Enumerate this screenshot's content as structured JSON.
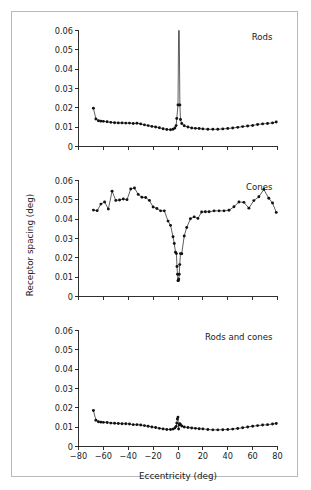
{
  "figure": {
    "background_color": "#ffffff",
    "frame_color": "#b9b9b9",
    "line_color": "#2b2b2b",
    "point_color": "#111111",
    "axis_color": "#1a1a1a",
    "y_axis_title": "Receptor spacing (deg)",
    "x_axis_title": "Eccentricity (deg)"
  },
  "chart_data": [
    {
      "type": "line",
      "title": "Rods",
      "panel_index": 0,
      "xlabel": "",
      "ylabel": "Receptor spacing (deg)",
      "xlim": [
        -80,
        80
      ],
      "ylim": [
        0,
        0.06
      ],
      "yticks": [
        0,
        0.01,
        0.02,
        0.03,
        0.04,
        0.05,
        0.06
      ],
      "ytick_labels": [
        "0",
        "0.01",
        "0.02",
        "0.03",
        "0.04",
        "0.05",
        "0.06"
      ],
      "xticks": [
        -80,
        -60,
        -40,
        -20,
        0,
        20,
        40,
        60,
        80
      ],
      "xtick_labels": [
        "",
        "",
        "",
        "",
        "",
        "",
        "",
        "",
        ""
      ],
      "grid": false,
      "legend": "none",
      "annotation": "Spike exceeds axis maximum at fovea (0 deg): rods absent",
      "x": [
        -68,
        -66,
        -64,
        -62,
        -60,
        -57,
        -54,
        -51,
        -48,
        -45,
        -42,
        -39,
        -36,
        -33,
        -30,
        -27,
        -24,
        -21,
        -18,
        -15,
        -12,
        -9,
        -6,
        -4,
        -2.5,
        -1.5,
        -1,
        0,
        0.5,
        1,
        1.5,
        2,
        3,
        5,
        8,
        11,
        14,
        17,
        20,
        24,
        28,
        32,
        36,
        40,
        44,
        48,
        52,
        56,
        60,
        64,
        68,
        72,
        76,
        79
      ],
      "y": [
        0.0198,
        0.0142,
        0.0133,
        0.0131,
        0.013,
        0.0128,
        0.0125,
        0.0123,
        0.0122,
        0.0122,
        0.0121,
        0.0121,
        0.0119,
        0.012,
        0.0117,
        0.0112,
        0.0108,
        0.0104,
        0.0101,
        0.0097,
        0.0092,
        0.0088,
        0.0087,
        0.0089,
        0.0096,
        0.0108,
        0.0145,
        0.0215,
        0.06,
        0.06,
        0.0215,
        0.014,
        0.0119,
        0.0107,
        0.0101,
        0.0096,
        0.0094,
        0.0093,
        0.0091,
        0.0089,
        0.0089,
        0.0089,
        0.0091,
        0.0093,
        0.0096,
        0.0099,
        0.0103,
        0.0106,
        0.0109,
        0.0114,
        0.0117,
        0.0119,
        0.0122,
        0.0127
      ]
    },
    {
      "type": "line",
      "title": "Cones",
      "panel_index": 1,
      "xlabel": "",
      "ylabel": "Receptor spacing (deg)",
      "xlim": [
        -80,
        80
      ],
      "ylim": [
        0,
        0.06
      ],
      "yticks": [
        0,
        0.01,
        0.02,
        0.03,
        0.04,
        0.05,
        0.06
      ],
      "ytick_labels": [
        "0",
        "0.01",
        "0.02",
        "0.03",
        "0.04",
        "0.05",
        "0.06"
      ],
      "xticks": [
        -80,
        -60,
        -40,
        -20,
        0,
        20,
        40,
        60,
        80
      ],
      "xtick_labels": [
        "",
        "",
        "",
        "",
        "",
        "",
        "",
        "",
        ""
      ],
      "grid": false,
      "legend": "none",
      "annotation": "Sharp minimum at fovea (0 deg): cone spacing ~0.008 deg",
      "x": [
        -68,
        -65,
        -62,
        -59,
        -56,
        -53,
        -50,
        -47,
        -44,
        -41,
        -38,
        -35,
        -32,
        -29,
        -26,
        -23,
        -20,
        -17,
        -14,
        -11,
        -8,
        -6,
        -4,
        -3,
        -2,
        -1.3,
        -0.8,
        -0.4,
        0,
        0.3,
        0.6,
        1,
        1.4,
        2,
        3,
        5,
        7,
        10,
        13,
        16,
        19,
        22,
        25,
        29,
        33,
        37,
        41,
        45,
        49,
        53,
        57,
        61,
        65,
        69,
        73,
        76,
        79
      ],
      "y": [
        0.0447,
        0.0444,
        0.0478,
        0.0489,
        0.0452,
        0.0545,
        0.0497,
        0.0499,
        0.0504,
        0.0501,
        0.0556,
        0.0561,
        0.0528,
        0.0513,
        0.0512,
        0.0497,
        0.0463,
        0.0455,
        0.0443,
        0.0443,
        0.039,
        0.0368,
        0.0309,
        0.0274,
        0.0229,
        0.0222,
        0.0155,
        0.0115,
        0.0082,
        0.0083,
        0.009,
        0.0115,
        0.0165,
        0.0222,
        0.0221,
        0.0313,
        0.0357,
        0.0402,
        0.0412,
        0.0404,
        0.0437,
        0.0438,
        0.0438,
        0.0443,
        0.0443,
        0.0443,
        0.0446,
        0.0464,
        0.0489,
        0.0487,
        0.0457,
        0.0496,
        0.0516,
        0.0554,
        0.0508,
        0.0484,
        0.0435
      ]
    },
    {
      "type": "line",
      "title": "Rods and cones",
      "panel_index": 2,
      "xlabel": "Eccentricity (deg)",
      "ylabel": "Receptor spacing (deg)",
      "xlim": [
        -80,
        80
      ],
      "ylim": [
        0,
        0.06
      ],
      "yticks": [
        0,
        0.01,
        0.02,
        0.03,
        0.04,
        0.05,
        0.06
      ],
      "ytick_labels": [
        "0",
        "0.01",
        "0.02",
        "0.03",
        "0.04",
        "0.05",
        "0.06"
      ],
      "xticks": [
        -80,
        -60,
        -40,
        -20,
        0,
        20,
        40,
        60,
        80
      ],
      "xtick_labels": [
        "-80",
        "-60",
        "-40",
        "-20",
        "0",
        "20",
        "40",
        "60",
        "80"
      ],
      "grid": false,
      "legend": "none",
      "annotation": "Small local peak at fovea (0 deg)",
      "x": [
        -68,
        -66,
        -64,
        -62,
        -60,
        -57,
        -54,
        -51,
        -48,
        -45,
        -42,
        -39,
        -36,
        -33,
        -30,
        -27,
        -24,
        -21,
        -18,
        -15,
        -12,
        -9,
        -6,
        -4,
        -2.5,
        -1.5,
        -1,
        -0.5,
        0,
        0.5,
        1,
        1.5,
        2,
        3,
        5,
        8,
        11,
        14,
        17,
        20,
        24,
        28,
        32,
        36,
        40,
        44,
        48,
        52,
        56,
        60,
        64,
        68,
        72,
        76,
        79
      ],
      "y": [
        0.0186,
        0.0136,
        0.0128,
        0.0126,
        0.0125,
        0.0124,
        0.0121,
        0.012,
        0.0119,
        0.0118,
        0.0118,
        0.0116,
        0.0113,
        0.0113,
        0.0111,
        0.0108,
        0.0105,
        0.0101,
        0.0098,
        0.0094,
        0.0091,
        0.0088,
        0.0088,
        0.009,
        0.0096,
        0.0104,
        0.0121,
        0.0142,
        0.0152,
        0.009,
        0.0113,
        0.0118,
        0.0113,
        0.0106,
        0.0101,
        0.0098,
        0.0096,
        0.0094,
        0.0092,
        0.0091,
        0.0088,
        0.0086,
        0.0086,
        0.0087,
        0.0088,
        0.009,
        0.0093,
        0.0097,
        0.0101,
        0.0105,
        0.0108,
        0.0111,
        0.0113,
        0.0116,
        0.0119
      ]
    }
  ]
}
